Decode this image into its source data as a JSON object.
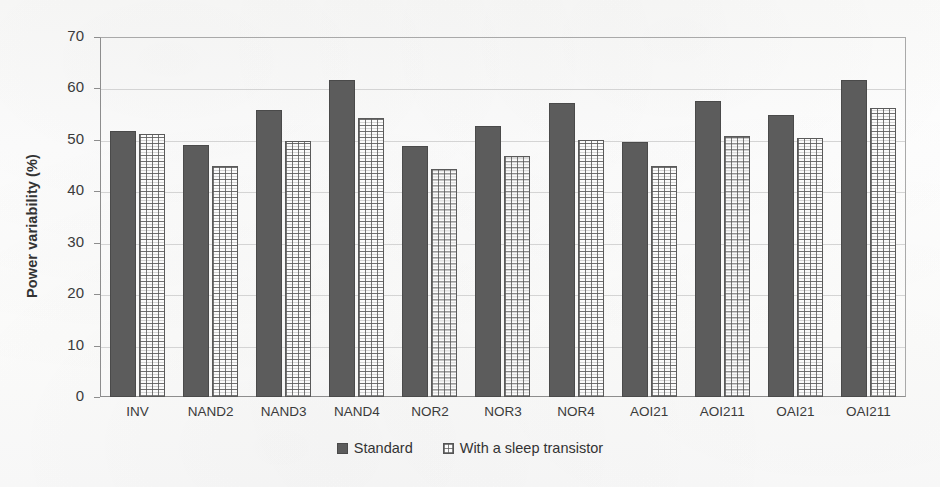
{
  "chart_data": {
    "type": "bar",
    "title": "",
    "xlabel": "",
    "ylabel": "Power variability (%)",
    "ylim": [
      0,
      70
    ],
    "ytick_step": 10,
    "yticks": [
      "70",
      "60",
      "50",
      "40",
      "30",
      "20",
      "10",
      "0"
    ],
    "grid": true,
    "legend_position": "bottom-center",
    "categories": [
      "INV",
      "NAND2",
      "NAND3",
      "NAND4",
      "NOR2",
      "NOR3",
      "NOR4",
      "AOI21",
      "AOI211",
      "OAI21",
      "OAI211"
    ],
    "series": [
      {
        "name": "Standard",
        "style": "solid-dark-gray",
        "color": "#5c5c5c",
        "values": [
          51.9,
          49.2,
          56.0,
          61.8,
          49.0,
          52.9,
          57.3,
          49.7,
          57.8,
          55.0,
          61.8
        ]
      },
      {
        "name": "With a sleep transistor",
        "style": "white-dotted-grid",
        "color": "#ffffff",
        "values": [
          51.3,
          45.1,
          49.9,
          54.4,
          44.6,
          47.1,
          50.1,
          45.1,
          51.0,
          50.5,
          56.3
        ]
      }
    ]
  },
  "axes": {
    "y_title": "Power variability (%)"
  },
  "legend": {
    "items": [
      {
        "label": "Standard",
        "swatch": "solid-square-icon"
      },
      {
        "label": "With a sleep transistor",
        "swatch": "hollow-square-icon"
      }
    ]
  },
  "colors": {
    "series_standard": "#5c5c5c",
    "series_sleep_fill": "#fbfbfb",
    "series_sleep_outline": "#5a5a5a",
    "gridline": "#d4d4d4",
    "axis": "#8d8d8d",
    "text": "#3b3b3b",
    "background": "#fdfdfd"
  }
}
